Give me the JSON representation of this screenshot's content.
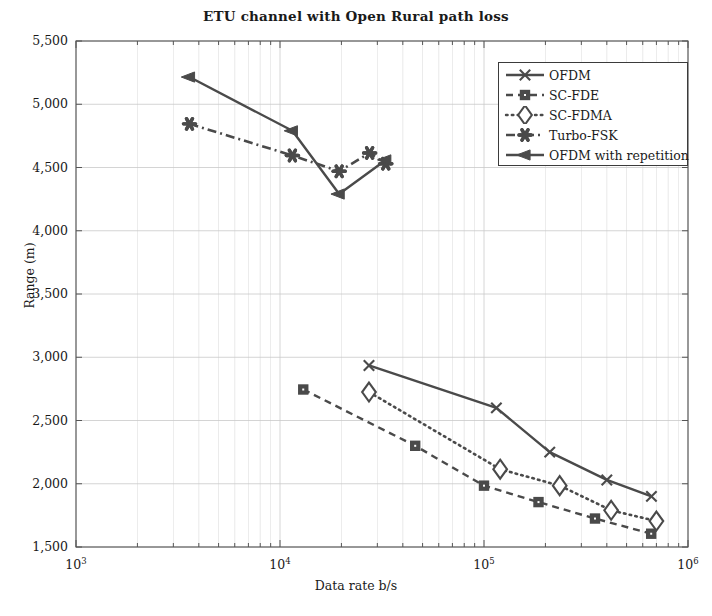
{
  "chart_data": {
    "type": "line",
    "title": "ETU channel with Open Rural path loss",
    "xlabel": "Data rate b/s",
    "ylabel": "Range (m)",
    "xscale": "log",
    "yscale": "linear",
    "xlim": [
      1000,
      1000000
    ],
    "ylim": [
      1500,
      5500
    ],
    "grid": true,
    "legend_position": "upper right",
    "xticks": [
      "10^3",
      "10^4",
      "10^5",
      "10^6"
    ],
    "xtick_labels": [
      "10",
      "10",
      "10",
      "10"
    ],
    "xtick_exponents": [
      "3",
      "4",
      "5",
      "6"
    ],
    "yticks": [
      1500,
      2000,
      2500,
      3000,
      3500,
      4000,
      4500,
      5000,
      5500
    ],
    "ytick_labels": [
      "1,500",
      "2,000",
      "2,500",
      "3,000",
      "3,500",
      "4,000",
      "4,500",
      "5,000",
      "5,500"
    ],
    "line_color": "#4a4a4a",
    "grid_color": "#c9c9c9",
    "axis_color": "#555555",
    "series": [
      {
        "name": "OFDM",
        "marker": "x",
        "dash": "solid",
        "x": [
          27300,
          115000,
          210000,
          400000,
          662000
        ],
        "y": [
          2935,
          2600,
          2250,
          2030,
          1900
        ]
      },
      {
        "name": "SC-FDE",
        "marker": "square",
        "dash": "dashed",
        "x": [
          13000,
          46000,
          100000,
          185000,
          350000,
          660000
        ],
        "y": [
          2745,
          2300,
          1985,
          1855,
          1725,
          1605
        ]
      },
      {
        "name": "SC-FDMA",
        "marker": "diamond",
        "dash": "dotted",
        "x": [
          27300,
          120000,
          235000,
          420000,
          700000
        ],
        "y": [
          2725,
          2115,
          1985,
          1790,
          1705
        ]
      },
      {
        "name": "Turbo-FSK",
        "marker": "asterisk",
        "dash": "dashdot",
        "x": [
          3600,
          11500,
          19500,
          27500,
          33000
        ],
        "y": [
          4845,
          4595,
          4470,
          4615,
          4530
        ]
      },
      {
        "name": "OFDM with repetition",
        "marker": "left-triangle",
        "dash": "solid",
        "x": [
          3600,
          11500,
          19500,
          33000
        ],
        "y": [
          5215,
          4790,
          4290,
          4560
        ]
      }
    ]
  },
  "legend": {
    "items": [
      {
        "label": "OFDM"
      },
      {
        "label": "SC-FDE"
      },
      {
        "label": "SC-FDMA"
      },
      {
        "label": "Turbo-FSK"
      },
      {
        "label": "OFDM with repetition"
      }
    ]
  },
  "axes": {
    "y_ticks": [
      "5,500",
      "5,000",
      "4,500",
      "4,000",
      "3,500",
      "3,000",
      "2,500",
      "2,000",
      "1,500"
    ],
    "x_ticks": [
      {
        "base": "10",
        "exp": "3"
      },
      {
        "base": "10",
        "exp": "4"
      },
      {
        "base": "10",
        "exp": "5"
      },
      {
        "base": "10",
        "exp": "6"
      }
    ]
  }
}
